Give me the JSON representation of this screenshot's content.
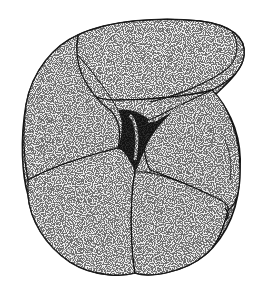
{
  "figure": {
    "style": "stippled-ink-drawing",
    "colors": {
      "background": "#ffffff",
      "shell_fill": "#f2f2f2",
      "outline": "#1a1a1a",
      "shadow": "#bdbdbd"
    }
  }
}
